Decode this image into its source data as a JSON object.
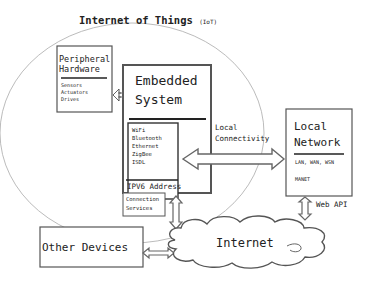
{
  "title": {
    "main": "Internet of Things",
    "sub": "(IoT)"
  },
  "peripheral": {
    "title_line1": "Peripheral",
    "title_line2": "Hardware",
    "items": [
      "Sensors",
      "Actuators",
      "Drives"
    ]
  },
  "embedded": {
    "title_line1": "Embedded",
    "title_line2": "System",
    "protocols": [
      "WiFi",
      "Bluetooth",
      "Ethernet",
      "ZigBee",
      "ISDL"
    ],
    "address": "IPV6 Address"
  },
  "connection_services": {
    "line1": "Connection",
    "line2": "Services"
  },
  "local_connectivity": {
    "line1": "Local",
    "line2": "Connectivity"
  },
  "local_network": {
    "title_line1": "Local",
    "title_line2": "Network",
    "items": [
      "LAN, WAN, WSN",
      "MANET"
    ]
  },
  "web_api": "Web API",
  "internet": "Internet",
  "other_devices": "Other Devices"
}
